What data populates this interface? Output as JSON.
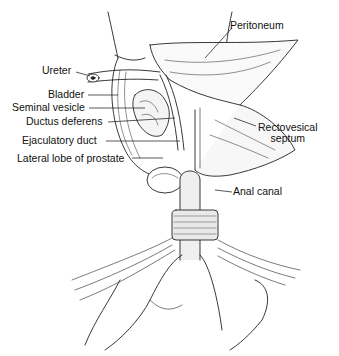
{
  "figure": {
    "type": "anatomical illustration",
    "labels": {
      "peritoneum": "Peritoneum",
      "ureter": "Ureter",
      "bladder": "Bladder",
      "seminal_vesicle": "Seminal vesicle",
      "ductus_deferens": "Ductus deferens",
      "rectovesical_septum_line1": "Rectovesical",
      "rectovesical_septum_line2": "septum",
      "ejaculatory_duct": "Ejaculatory duct",
      "lateral_lobe_prostate": "Lateral lobe of prostate",
      "anal_canal": "Anal canal"
    },
    "colors": {
      "ink": "#111111",
      "background": "#ffffff",
      "stipple": "#cfcfcf"
    }
  }
}
